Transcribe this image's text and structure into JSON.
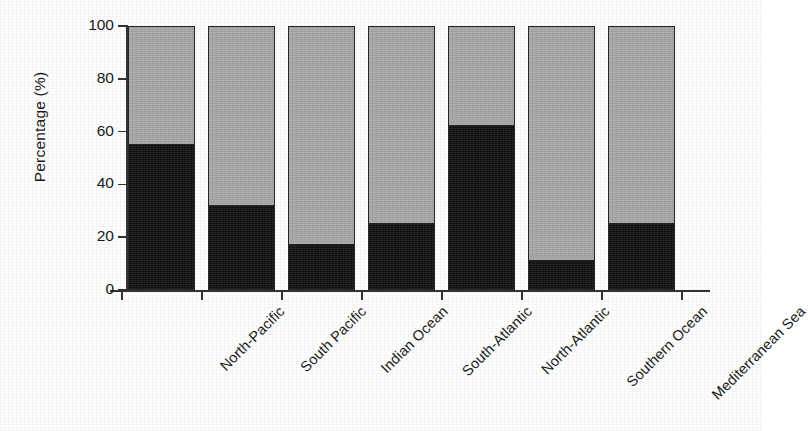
{
  "chart_data": {
    "type": "bar",
    "title": "",
    "subtitle": "",
    "xlabel": "",
    "ylabel": "Percentage (%)",
    "ylim": [
      0,
      100
    ],
    "yticks": [
      0,
      20,
      40,
      60,
      80,
      100
    ],
    "ytick_labels": [
      "0",
      "20",
      "40",
      "60",
      "80",
      "100"
    ],
    "grid": false,
    "legend": null,
    "stacked": true,
    "stack_total": 100,
    "categories": [
      "North-Pacific",
      "South Pacific",
      "Indian Ocean",
      "South-Atlantic",
      "North-Atlantic",
      "Southern Ocean",
      "Mediterranean Sea"
    ],
    "series": [
      {
        "name": "dark-segment",
        "color": "#121212",
        "values": [
          55,
          32,
          17,
          25,
          62,
          11,
          25
        ]
      },
      {
        "name": "light-segment",
        "color": "#ababab",
        "values": [
          45,
          68,
          83,
          75,
          38,
          89,
          75
        ]
      }
    ]
  },
  "axes": {
    "y_title": "Percentage (%)",
    "y_tick_labels": [
      "100",
      "80",
      "60",
      "40",
      "20",
      "0"
    ]
  }
}
